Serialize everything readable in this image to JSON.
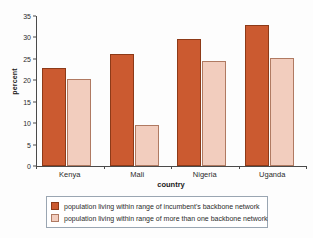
{
  "chart_data": {
    "type": "bar",
    "title": "",
    "xlabel": "country",
    "ylabel": "percent",
    "categories": [
      "Kenya",
      "Mali",
      "Nigeria",
      "Uganda"
    ],
    "series": [
      {
        "name": "population living within range of incumbent's backbone network",
        "color": "#CB5A30",
        "values": [
          22.8,
          26.2,
          29.6,
          32.8
        ]
      },
      {
        "name": "population living within range of more than one backbone network",
        "color": "#F2CDBE",
        "values": [
          20.2,
          9.5,
          24.6,
          25.2
        ]
      }
    ],
    "ylim": [
      0,
      35
    ],
    "yticks": [
      0,
      5,
      10,
      15,
      20,
      25,
      30,
      35
    ],
    "ytick_labels": [
      "0",
      "5",
      "10",
      "15",
      "20",
      "25",
      "30",
      "35"
    ],
    "grid": false,
    "legend_position": "bottom"
  }
}
